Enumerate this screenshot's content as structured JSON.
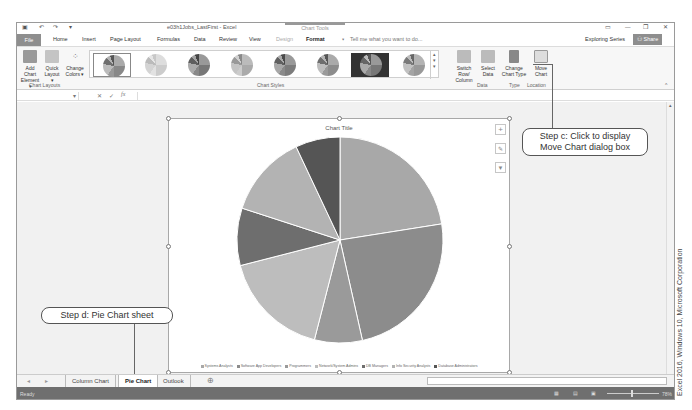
{
  "window": {
    "doc_title": "e03h1Jobs_LastFirst - Excel",
    "contextual_group": "Chart Tools",
    "controls": [
      "ribbon-display-icon",
      "minimize-icon",
      "restore-icon",
      "close-icon"
    ],
    "control_glyphs": [
      "▭",
      "—",
      "❐",
      "✕"
    ],
    "quick_access": [
      "save-icon",
      "undo-icon",
      "redo-icon",
      "customize-icon"
    ],
    "quick_access_glyphs": [
      "🖫",
      "↶",
      "↷",
      "▾"
    ]
  },
  "ribbon_tabs": [
    "File",
    "Home",
    "Insert",
    "Page Layout",
    "Formulas",
    "Data",
    "Review",
    "View",
    "Design",
    "Format"
  ],
  "active_tab": "Design",
  "tell_me": "Tell me what you want to do...",
  "user": "Exploring Series",
  "share_label": "Share",
  "ribbon": {
    "chart_layouts": {
      "group_label": "Chart Layouts",
      "add_chart_element": [
        "Add Chart",
        "Element ▾"
      ],
      "quick_layout": [
        "Quick",
        "Layout ▾"
      ],
      "change_colors": [
        "Change",
        "Colors ▾"
      ]
    },
    "chart_styles": {
      "group_label": "Chart Styles",
      "style_count": 8,
      "selected_index": 0
    },
    "data": {
      "group_label": "Data",
      "switch": [
        "Switch Row/",
        "Column"
      ],
      "select": [
        "Select",
        "Data"
      ]
    },
    "type": {
      "group_label": "Type",
      "change": [
        "Change",
        "Chart Type"
      ]
    },
    "location": {
      "group_label": "Location",
      "move": [
        "Move",
        "Chart"
      ]
    }
  },
  "formula_bar": {
    "name_box": "",
    "fx": "fx",
    "cancel": "✕",
    "enter": "✓"
  },
  "chart_data": {
    "type": "pie",
    "title": "Chart Title",
    "categories": [
      "Systems Analysts",
      "Software App Developers",
      "Programmers",
      "Network/System Admins",
      "DB Managers",
      "Info Security Analysts",
      "Database Administrators"
    ],
    "values": [
      22.5,
      24,
      7.5,
      17,
      9,
      13,
      7
    ],
    "unit": "percent of total (estimated)",
    "colors": [
      "#a8a8a8",
      "#8c8c8c",
      "#9a9a9a",
      "#bdbdbd",
      "#6e6e6e",
      "#b3b3b3",
      "#555555"
    ],
    "legend_position": "bottom",
    "legend_labels": [
      "Systems Analysts",
      "Software App Developers",
      "Programmers",
      "Network/System Admins",
      "DB Managers",
      "Info Security Analysts",
      "Database Administrators"
    ]
  },
  "chart_buttons": [
    "+",
    "🖌",
    "▼"
  ],
  "callouts": {
    "step_c": [
      "Step c: Click to display",
      "Move Chart dialog box"
    ],
    "step_d": "Step d: Pie Chart sheet"
  },
  "sheet_tabs": [
    "Column Chart",
    "Pie Chart",
    "Outlook"
  ],
  "active_sheet": "Pie Chart",
  "new_sheet": "⊕",
  "status": {
    "ready": "Ready",
    "zoom": "78%"
  },
  "credit": "Excel 2016, Windows 10, Microsoft Corporation"
}
